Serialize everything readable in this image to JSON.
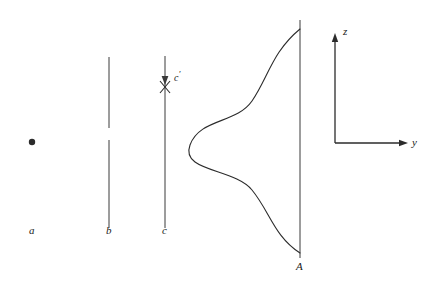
{
  "figure": {
    "background_color": "#ffffff",
    "ink_color": "#2b2b2b",
    "width": 432,
    "height": 285,
    "labels": {
      "point_a": "a",
      "line_b": "b",
      "line_c": "c",
      "line_c_prime": "c",
      "line_c_prime_mark": "′",
      "line_A": "A",
      "axis_z": "z",
      "axis_y": "y"
    },
    "elements": {
      "point_a": {
        "name": "point-a",
        "x": 32,
        "y": 142,
        "radius": 3.2
      },
      "line_b": {
        "name": "line-b",
        "x": 109,
        "y_top": 57,
        "y_bottom": 228,
        "gap_top": 128,
        "gap_bottom": 140
      },
      "line_c": {
        "name": "line-c",
        "x": 165,
        "y_top": 56,
        "y_bottom": 228,
        "arrow_tip_y": 84,
        "cross_y": 87,
        "cross_half_width": 5,
        "cross_half_height": 6
      },
      "line_A": {
        "name": "line-a-capital",
        "x": 300,
        "y_top": 20,
        "y_bottom": 258
      },
      "bell_curve": {
        "name": "bell-curve",
        "baseline_x": 300,
        "peak_x": 190,
        "y_top": 29,
        "y_center": 145,
        "y_bottom": 253
      },
      "axis_z": {
        "name": "axis-z",
        "x": 335,
        "y_top": 33,
        "y_bottom": 143,
        "arrow_size": 5
      },
      "axis_y": {
        "name": "axis-y",
        "y": 143,
        "x_left": 335,
        "x_right": 408,
        "arrow_size": 5
      }
    },
    "label_positions": {
      "point_a": {
        "x": 29,
        "y": 225
      },
      "line_b": {
        "x": 106,
        "y": 225
      },
      "line_c": {
        "x": 162,
        "y": 225
      },
      "line_c_prime": {
        "x": 174,
        "y": 70
      },
      "line_A": {
        "x": 296,
        "y": 261
      },
      "axis_z": {
        "x": 343,
        "y": 29
      },
      "axis_y": {
        "x": 412,
        "y": 138
      }
    }
  }
}
